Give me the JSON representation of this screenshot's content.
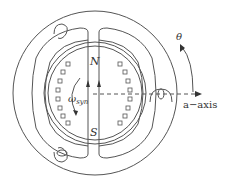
{
  "diagram": {
    "labels": {
      "north": "N",
      "south": "S",
      "omega": "ω",
      "omega_sub": "syn",
      "theta": "θ",
      "axis": "a−axis"
    },
    "colors": {
      "line": "#555555",
      "text": "#333333",
      "background": "#ffffff"
    },
    "geometry": {
      "center": [
        95,
        93
      ],
      "stator_outer_radius": 82,
      "stator_inner_radius": 64,
      "airgap_radius": 51,
      "rotor_radius": 47,
      "rotor_slots_per_side": 8
    }
  }
}
